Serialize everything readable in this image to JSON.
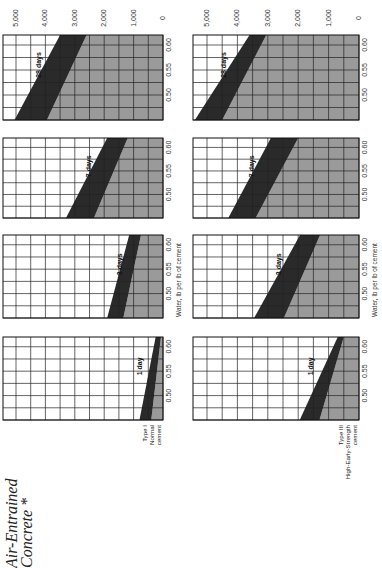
{
  "chart_data": {
    "type": "area",
    "orientation": "rotated-90",
    "xlabel": "Water, lb per lb of cement",
    "ylabel": "Compressive strength, psi",
    "x_ticks": [
      "0.50",
      "0.55",
      "0.60"
    ],
    "y_ticks": [
      "5,000",
      "4,000",
      "3,000",
      "2,000",
      "1,000",
      "0"
    ],
    "xlim": [
      0.45,
      0.62
    ],
    "ylim": [
      0,
      5000
    ],
    "grid": true,
    "colors": {
      "band": "#2a2a2a",
      "below": "#9a9a9a",
      "grid": "#222222",
      "paper": "#ffffff"
    },
    "columns": [
      {
        "cement_label": [
          "Type I",
          "Normal",
          "cement"
        ],
        "panels": [
          {
            "age": "28 days",
            "wc": [
              0.45,
              0.62
            ],
            "upper": [
              5050,
              3500
            ],
            "lower": [
              3950,
              2600
            ]
          },
          {
            "age": "7 days",
            "wc": [
              0.45,
              0.62
            ],
            "upper": [
              3300,
              1900
            ],
            "lower": [
              2350,
              1200
            ]
          },
          {
            "age": "3 days",
            "wc": [
              0.45,
              0.62
            ],
            "upper": [
              1900,
              1150
            ],
            "lower": [
              1350,
              750
            ]
          },
          {
            "age": "1 day",
            "wc": [
              0.45,
              0.62
            ],
            "upper": [
              800,
              250
            ],
            "lower": [
              400,
              70
            ]
          }
        ]
      },
      {
        "cement_label": [
          "Type III",
          "High-Early-Strength",
          "cement"
        ],
        "panels": [
          {
            "age": "28 days",
            "wc": [
              0.45,
              0.62
            ],
            "upper": [
              5400,
              3600
            ],
            "lower": [
              4500,
              3050
            ]
          },
          {
            "age": "7 days",
            "wc": [
              0.45,
              0.62
            ],
            "upper": [
              4300,
              2900
            ],
            "lower": [
              3400,
              2000
            ]
          },
          {
            "age": "3 days",
            "wc": [
              0.45,
              0.62
            ],
            "upper": [
              3450,
              1940
            ],
            "lower": [
              2470,
              1280
            ]
          },
          {
            "age": "1 day",
            "wc": [
              0.45,
              0.62
            ],
            "upper": [
              1950,
              700
            ],
            "lower": [
              1300,
              500
            ]
          }
        ]
      }
    ]
  }
}
